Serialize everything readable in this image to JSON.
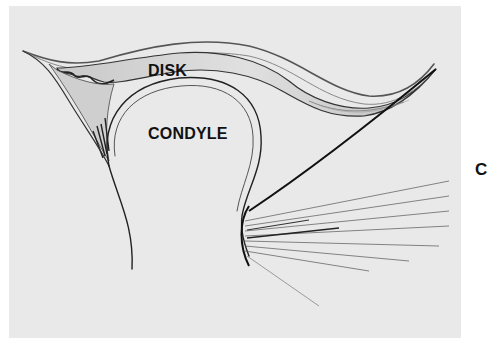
{
  "figure": {
    "panel_letter": "C",
    "labels": {
      "disk": "DISK",
      "condyle": "CONDYLE"
    },
    "colors": {
      "background": "#ffffff",
      "panel": "#e9e9e9",
      "ink": "#111111",
      "shade": "#b8b8b8"
    }
  }
}
